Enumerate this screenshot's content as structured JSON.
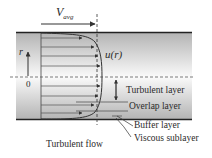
{
  "diagram": {
    "title": "Turbulent flow",
    "labels": {
      "v_avg": "V",
      "v_avg_sub": "avg",
      "u_r": "u(r)",
      "r_axis": "r",
      "origin": "0",
      "turbulent_layer": "Turbulent layer",
      "overlap_layer": "Overlap layer",
      "buffer_layer": "Buffer layer",
      "viscous_sublayer": "Viscous sublayer",
      "caption": "Turbulent flow"
    },
    "colors": {
      "pipe_wall_shade": "#b8b8b8",
      "pipe_center": "#ffffff",
      "lines": "#333333",
      "text": "#2a2a2a"
    }
  }
}
